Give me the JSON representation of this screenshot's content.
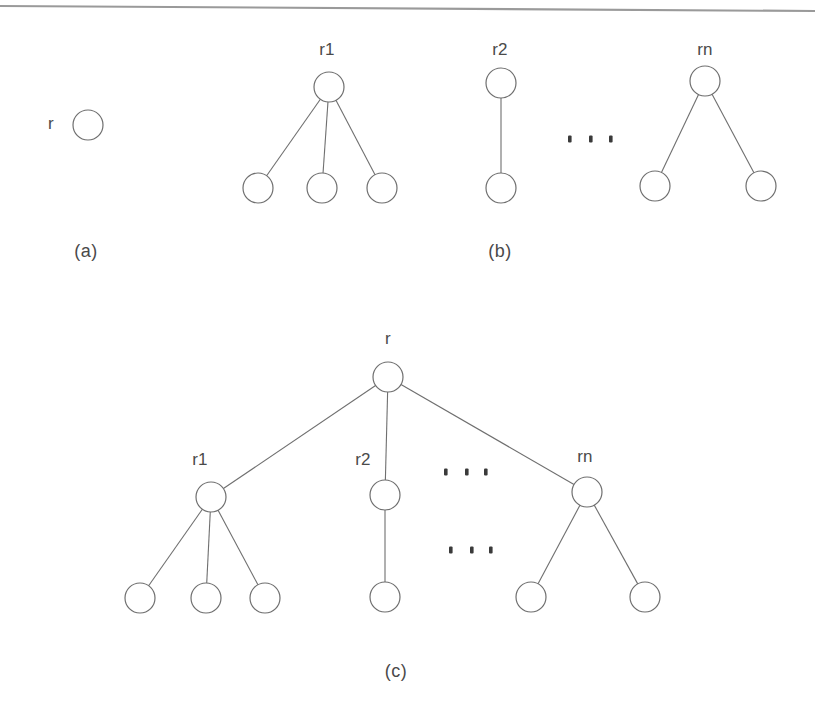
{
  "figure": {
    "width": 815,
    "height": 715,
    "background": "#ffffff",
    "stroke_color": "#6f6f6f",
    "text_color": "#4a4a4a",
    "dot_color": "#3a3a3a",
    "rule_color": "#9a9a9a"
  },
  "top_rule": {
    "x1": 0,
    "y1": 6,
    "x2": 815,
    "y2": 11
  },
  "panels": {
    "a": {
      "caption": "(a)",
      "caption_x": 86,
      "caption_y": 252,
      "root_label": "r",
      "root_label_x": 51,
      "root_label_y": 125,
      "node_x": 88,
      "node_y": 125,
      "node_r": 15
    },
    "b": {
      "caption": "(b)",
      "caption_x": 500,
      "caption_y": 252,
      "tree1": {
        "label": "r1",
        "label_x": 327,
        "label_y": 51,
        "root_x": 329,
        "root_y": 87,
        "leaves_x": [
          258,
          322,
          382
        ],
        "leaves_y": 188
      },
      "tree2": {
        "label": "r2",
        "label_x": 500,
        "label_y": 51,
        "root_x": 501,
        "root_y": 83,
        "child_x": 501,
        "child_y": 188
      },
      "treen": {
        "label": "rn",
        "label_x": 705,
        "label_y": 51,
        "root_x": 705,
        "root_y": 81,
        "leaves_x": [
          655,
          761
        ],
        "leaves_y": 186
      },
      "ellipsis": {
        "y": 139,
        "x": [
          570,
          591,
          611
        ]
      },
      "node_r": 15
    },
    "c": {
      "caption": "(c)",
      "caption_x": 396,
      "caption_y": 672,
      "root_label": "r",
      "root_label_x": 388,
      "root_label_y": 340,
      "root_x": 388,
      "root_y": 377,
      "node_r": 15,
      "subtrees": [
        {
          "label": "r1",
          "label_x": 200,
          "label_y": 461,
          "root_x": 211,
          "root_y": 497,
          "leaves_x": [
            140,
            206,
            265
          ],
          "leaves_y": 598
        },
        {
          "label": "r2",
          "label_x": 363,
          "label_y": 461,
          "root_x": 385,
          "root_y": 495,
          "leaves_x": [
            385
          ],
          "leaves_y": 597
        },
        {
          "label": "rn",
          "label_x": 585,
          "label_y": 458,
          "root_x": 587,
          "root_y": 492,
          "leaves_x": [
            531,
            645
          ],
          "leaves_y": 597
        }
      ],
      "ellipsis_upper": {
        "y": 472,
        "x": [
          446,
          467,
          486
        ]
      },
      "ellipsis_lower": {
        "y": 550,
        "x": [
          451,
          472,
          491
        ]
      }
    }
  }
}
